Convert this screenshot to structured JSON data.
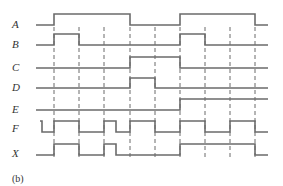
{
  "diagram": {
    "type": "timing-diagram",
    "caption": "(b)",
    "time_marks_x": [
      54,
      79,
      104,
      130,
      155,
      180,
      205,
      230,
      255
    ],
    "x_start": 36,
    "x_end": 268,
    "signals": [
      {
        "name": "A",
        "label_y": 24,
        "low_y": 25,
        "high_y": 14,
        "initial": 0,
        "transitions": [
          54,
          130,
          180,
          255
        ]
      },
      {
        "name": "B",
        "label_y": 44,
        "low_y": 45,
        "high_y": 34,
        "initial": 0,
        "transitions": [
          54,
          79,
          180,
          205
        ]
      },
      {
        "name": "C",
        "label_y": 67,
        "low_y": 68,
        "high_y": 57,
        "initial": 0,
        "transitions": [
          130,
          180
        ]
      },
      {
        "name": "D",
        "label_y": 87,
        "low_y": 88,
        "high_y": 78,
        "initial": 0,
        "transitions": [
          130,
          155
        ]
      },
      {
        "name": "E",
        "label_y": 109,
        "low_y": 110,
        "high_y": 99,
        "initial": 0,
        "transitions": [
          180
        ]
      },
      {
        "name": "F",
        "label_y": 128,
        "low_y": 132,
        "high_y": 121,
        "initial": 1,
        "start_x": 40,
        "transitions": [
          42,
          54,
          79,
          104,
          116,
          130,
          155,
          180,
          205,
          230,
          255
        ]
      },
      {
        "name": "X",
        "label_y": 153,
        "low_y": 155,
        "high_y": 144,
        "initial": 0,
        "transitions": [
          54,
          79,
          104,
          116,
          180,
          255
        ]
      }
    ]
  }
}
